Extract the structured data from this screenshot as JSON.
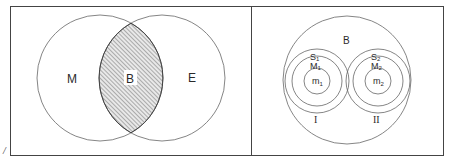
{
  "figure": {
    "margin_mark": "/",
    "colors": {
      "line": "#555555",
      "border": "#444444",
      "hatch": "#777777",
      "background": "#ffffff"
    }
  },
  "left_panel": {
    "description": "Two overlapping circles with shaded intersection",
    "circles": [
      {
        "id": "M",
        "label": "M"
      },
      {
        "id": "E",
        "label": "E"
      }
    ],
    "intersection": {
      "label": "B",
      "fill": "hatched"
    }
  },
  "right_panel": {
    "description": "Large circle containing two concentric-circle systems",
    "outer": {
      "label": "B"
    },
    "systems": [
      {
        "id": "I",
        "label": "I",
        "rings": [
          "S1",
          "M1",
          "m1"
        ],
        "ring_labels": {
          "outer": "S",
          "outer_sub": "1",
          "middle": "M",
          "middle_sub": "1",
          "inner": "m",
          "inner_sub": "1"
        }
      },
      {
        "id": "II",
        "label": "II",
        "rings": [
          "S2",
          "M2",
          "m2"
        ],
        "ring_labels": {
          "outer": "S",
          "outer_sub": "2",
          "middle": "M",
          "middle_sub": "2",
          "inner": "m",
          "inner_sub": "2"
        }
      }
    ]
  }
}
